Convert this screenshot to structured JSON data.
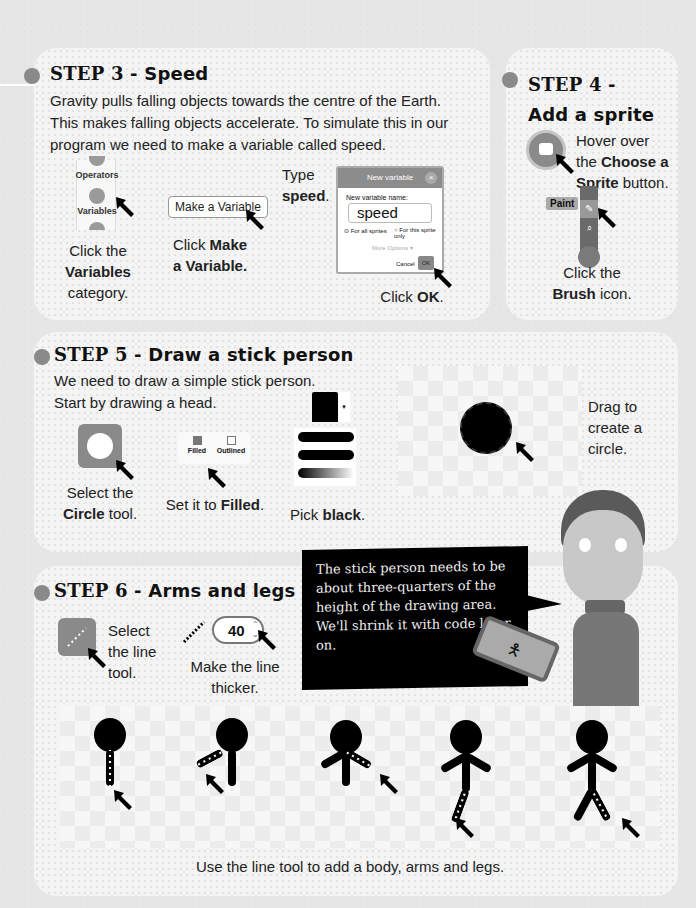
{
  "step3": {
    "title_num": "STEP 3",
    "title_rest": " - Speed",
    "body": "Gravity pulls falling objects towards the centre of the Earth. This makes falling objects accelerate. To simulate this in our program we need to make a variable called speed.",
    "categories": {
      "operators": "Operators",
      "variables": "Variables"
    },
    "caption1": {
      "pre": "Click the",
      "bold": "Variables",
      "post": "category."
    },
    "make_var_button": "Make a Variable",
    "caption2": {
      "pre": "Click",
      "bold": "Make a Variable."
    },
    "type_label": {
      "pre": "Type",
      "bold": "speed",
      "post": "."
    },
    "dialog": {
      "title": "New variable",
      "close": "×",
      "name_label": "New variable name:",
      "name_value": "speed",
      "radio_all": "For all sprites",
      "radio_this": "For this sprite only",
      "more_options": "More Options ▾",
      "cancel": "Cancel",
      "ok": "OK"
    },
    "caption3": {
      "pre": "Click",
      "bold": "OK",
      "post": "."
    }
  },
  "step4": {
    "title_num": "STEP 4",
    "title_rest": " -",
    "title_line2": "Add a sprite",
    "hover": {
      "pre": "Hover over the",
      "bold": "Choose a Sprite",
      "post": "button."
    },
    "paint_label": "Paint",
    "caption": {
      "pre": "Click the",
      "bold": "Brush",
      "post": "icon."
    }
  },
  "step5": {
    "title_num": "STEP 5",
    "title_rest": " - Draw a stick person",
    "body_line1": "We need to draw a simple stick person.",
    "body_line2": "Start by drawing a head.",
    "caption_circle": {
      "pre": "Select the",
      "bold": "Circle",
      "post": "tool."
    },
    "filled_label": "Filled",
    "outlined_label": "Outlined",
    "caption_filled": {
      "pre": "Set it to",
      "bold": "Filled",
      "post": "."
    },
    "caption_black": {
      "pre": "Pick",
      "bold": "black",
      "post": "."
    },
    "caption_drag": "Drag to create a circle."
  },
  "speech": "The stick person needs to be about three-quarters of the height of the drawing area. We'll shrink it with code later on.",
  "step6": {
    "title_num": "STEP 6",
    "title_rest": " - Arms and legs",
    "caption_line": "Select the line tool.",
    "thickness_value": "40",
    "caption_thicker": "Make the line thicker.",
    "caption_bottom": "Use the line tool to add a body, arms and legs."
  },
  "colors": {
    "bullet": "#8a8a8a",
    "tool": "#8a8a8a",
    "panel": "#f4f4f4",
    "speech_bg": "#000000"
  }
}
